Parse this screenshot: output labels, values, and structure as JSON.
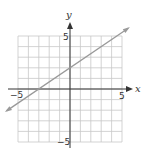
{
  "chart_data": {
    "type": "line",
    "title": "",
    "xlabel": "x",
    "ylabel": "y",
    "xlim": [
      -5,
      5
    ],
    "ylim": [
      -5,
      5
    ],
    "grid": true,
    "x_ticks_labeled": [
      "-5",
      "5"
    ],
    "y_ticks_labeled": [
      "5",
      "-5"
    ],
    "series": [
      {
        "name": "line",
        "equation": "y = (2/3)x + 2",
        "slope": 0.6667,
        "intercept": 2,
        "points": [
          [
            -3,
            0
          ],
          [
            0,
            2
          ],
          [
            3,
            4
          ]
        ],
        "extends_both_directions": true,
        "color": "#999999"
      }
    ]
  },
  "labels": {
    "x_axis": "x",
    "y_axis": "y",
    "x_min": "−5",
    "x_max": "5",
    "y_max": "5",
    "y_min": "−5"
  },
  "colors": {
    "grid": "#c8c8c8",
    "axis": "#333333",
    "line": "#9a9a9a"
  }
}
